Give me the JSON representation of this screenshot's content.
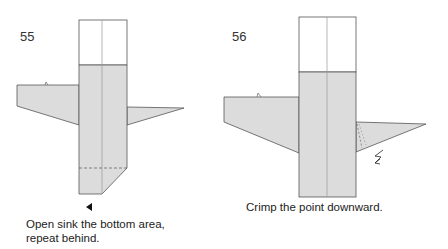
{
  "colors": {
    "paper_gray": "#dcdcdc",
    "paper_white": "#ffffff",
    "line": "#555555",
    "crease": "#aaaaaa",
    "text": "#222222"
  },
  "steps": [
    {
      "number": "55",
      "caption_line1": "Open sink the bottom area,",
      "caption_line2": "repeat behind.",
      "symbols": [
        "sink-arrow-icon",
        "valley-fold-dashed-line"
      ]
    },
    {
      "number": "56",
      "caption_line1": "Crimp the point downward.",
      "symbols": [
        "crimp-arrow-icon",
        "crimp-fold-dashed-line"
      ]
    }
  ]
}
